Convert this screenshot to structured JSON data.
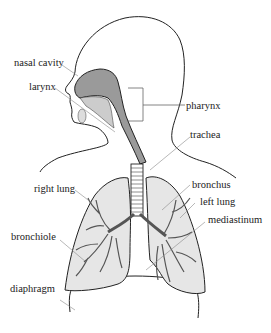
{
  "diagram": {
    "labels": {
      "nasal_cavity": "nasal cavity",
      "larynx": "larynx",
      "pharynx": "pharynx",
      "trachea": "trachea",
      "right_lung": "right lung",
      "bronchus": "bronchus",
      "left_lung": "left lung",
      "mediastinum": "mediastinum",
      "bronchiole": "bronchiole",
      "diaphragm": "diaphragm"
    },
    "colors": {
      "outline": "#222222",
      "lung_fill": "#e6e6e6",
      "airway_fill": "#9a9a9a",
      "leader_line": "#888888"
    }
  }
}
